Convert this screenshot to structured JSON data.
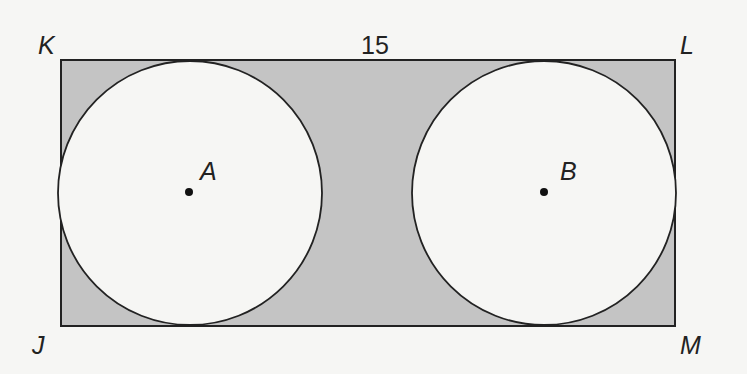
{
  "diagram": {
    "type": "geometry-figure",
    "vertices": {
      "K": "K",
      "L": "L",
      "M": "M",
      "J": "J"
    },
    "centers": {
      "A": "A",
      "B": "B"
    },
    "side_length_label": "15",
    "colors": {
      "shade": "#c4c4c4",
      "stroke": "#222222",
      "circle_fill": "#f6f6f4",
      "background": "#f6f6f4"
    }
  }
}
